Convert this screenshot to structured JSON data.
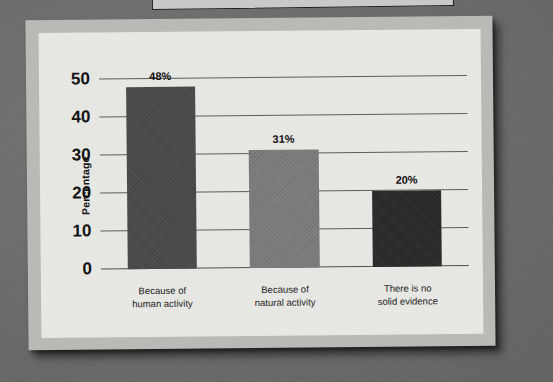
{
  "scan": {
    "background_color": "#6e6e6e",
    "frame_color": "#b9b9b6",
    "panel_color": "#e7e7e4",
    "top_strip_name": "partial-document-edge"
  },
  "chart_data": {
    "type": "bar",
    "title": "",
    "subtitle": "",
    "xlabel": "",
    "ylabel": "Percentage",
    "ylim": [
      0,
      55
    ],
    "yticks": [
      0,
      10,
      20,
      30,
      40,
      50
    ],
    "ytick_labels": [
      "0",
      "10",
      "20",
      "30",
      "40",
      "50"
    ],
    "grid": true,
    "grid_axis": "y",
    "legend": false,
    "legend_position": "none",
    "categories": [
      "Because of human activity",
      "Because of natural activity",
      "There is no solid evidence"
    ],
    "category_lines": [
      [
        "Because of",
        "human activity"
      ],
      [
        "Because of",
        "natural activity"
      ],
      [
        "There is no",
        "solid evidence"
      ]
    ],
    "values": [
      48,
      31,
      20
    ],
    "value_labels": [
      "48%",
      "31%",
      "20%"
    ],
    "bar_colors": [
      "#4a4a4a",
      "#7b7b7b",
      "#2a2a2a"
    ],
    "bars": [
      {
        "category_line1": "Because of",
        "category_line2": "human activity",
        "value": 48,
        "label": "48%",
        "color": "#4a4a4a"
      },
      {
        "category_line1": "Because of",
        "category_line2": "natural activity",
        "value": 31,
        "label": "31%",
        "color": "#7b7b7b"
      },
      {
        "category_line1": "There is no",
        "category_line2": "solid evidence",
        "value": 20,
        "label": "20%",
        "color": "#2a2a2a"
      }
    ]
  }
}
